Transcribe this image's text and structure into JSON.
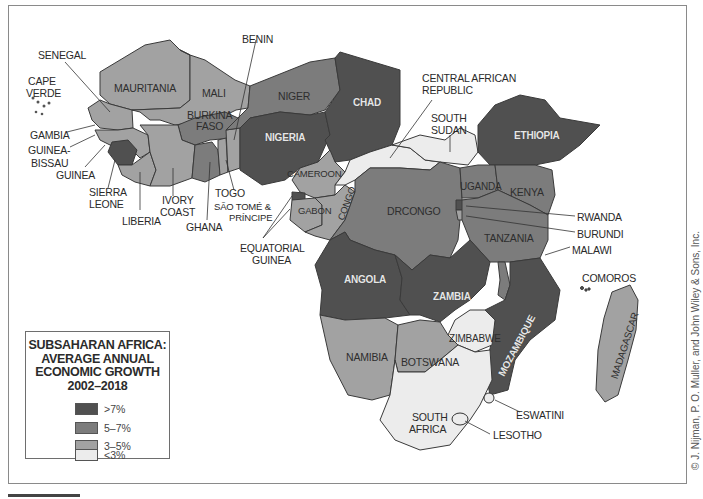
{
  "title": "SUBSAHARAN AFRICA: AVERAGE ANNUAL ECONOMIC GROWTH 2002–2018",
  "legend": {
    "title_lines": [
      "SUBSAHARAN AFRICA:",
      "AVERAGE ANNUAL",
      "ECONOMIC GROWTH",
      "2002–2018"
    ],
    "items": [
      {
        "label": ">7%",
        "color": "#505050"
      },
      {
        "label": "5–7%",
        "color": "#7c7c7c"
      },
      {
        "label": "3–5%",
        "color": "#a2a2a2"
      },
      {
        "label": "<3%",
        "color": "#ececec"
      }
    ]
  },
  "credit": "© J. Nijman, P. O. Muller, and John Wiley & Sons, Inc.",
  "colors": {
    "gt7": "#505050",
    "g5_7": "#7c7c7c",
    "g3_5": "#a2a2a2",
    "lt3": "#ececec",
    "border": "#3a3a3a"
  },
  "countries": {
    "senegal": {
      "label": "SENEGAL",
      "class": "3-5%"
    },
    "cape_verde": {
      "label": "CAPE VERDE",
      "class": "3-5%"
    },
    "mauritania": {
      "label": "MAURITANIA",
      "class": "3-5%"
    },
    "mali": {
      "label": "MALI",
      "class": "3-5%"
    },
    "benin": {
      "label": "BENIN",
      "class": "3-5%"
    },
    "niger": {
      "label": "NIGER",
      "class": "5-7%"
    },
    "chad": {
      "label": "CHAD",
      "class": ">7%"
    },
    "nigeria": {
      "label": "NIGERIA",
      "class": ">7%"
    },
    "burkina_faso": {
      "label": "BURKINA FASO",
      "class": "5-7%"
    },
    "gambia": {
      "label": "GAMBIA",
      "class": "3-5%"
    },
    "guinea_bissau": {
      "label": "GUINEA-BISSAU",
      "class": "3-5%"
    },
    "guinea": {
      "label": "GUINEA",
      "class": "3-5%"
    },
    "sierra_leone": {
      "label": "SIERRA LEONE",
      "class": ">7%"
    },
    "liberia": {
      "label": "LIBERIA",
      "class": "3-5%"
    },
    "ivory_coast": {
      "label": "IVORY COAST",
      "class": "3-5%"
    },
    "ghana": {
      "label": "GHANA",
      "class": "5-7%"
    },
    "togo": {
      "label": "TOGO",
      "class": "3-5%"
    },
    "sao_tome": {
      "label": "SÃO TOMÉ & PRÍNCIPE",
      "class": "3-5%"
    },
    "cameroon": {
      "label": "CAMEROON",
      "class": "3-5%"
    },
    "gabon": {
      "label": "GABON",
      "class": "3-5%"
    },
    "congo": {
      "label": "CONGO",
      "class": "3-5%"
    },
    "equatorial_guinea": {
      "label": "EQUATORIAL GUINEA",
      "class": ">7%"
    },
    "car": {
      "label": "CENTRAL AFRICAN REPUBLIC",
      "class": "<3%"
    },
    "south_sudan": {
      "label": "SOUTH SUDAN",
      "class": "<3%"
    },
    "ethiopia": {
      "label": "ETHIOPIA",
      "class": ">7%"
    },
    "uganda": {
      "label": "UGANDA",
      "class": "5-7%"
    },
    "kenya": {
      "label": "KENYA",
      "class": "5-7%"
    },
    "drcongo": {
      "label": "DRCONGO",
      "class": "5-7%"
    },
    "rwanda": {
      "label": "RWANDA",
      "class": ">7%"
    },
    "burundi": {
      "label": "BURUNDI",
      "class": "3-5%"
    },
    "tanzania": {
      "label": "TANZANIA",
      "class": "5-7%"
    },
    "malawi": {
      "label": "MALAWI",
      "class": "5-7%"
    },
    "comoros": {
      "label": "COMOROS",
      "class": "3-5%"
    },
    "angola": {
      "label": "ANGOLA",
      "class": ">7%"
    },
    "zambia": {
      "label": "ZAMBIA",
      "class": ">7%"
    },
    "mozambique": {
      "label": "MOZAMBIQUE",
      "class": ">7%"
    },
    "zimbabwe": {
      "label": "ZIMBABWE",
      "class": "<3%"
    },
    "namibia": {
      "label": "NAMIBIA",
      "class": "3-5%"
    },
    "botswana": {
      "label": "BOTSWANA",
      "class": "3-5%"
    },
    "madagascar": {
      "label": "MADAGASCAR",
      "class": "3-5%"
    },
    "south_africa": {
      "label": "SOUTH AFRICA",
      "class": "<3%"
    },
    "eswatini": {
      "label": "ESWATINI",
      "class": "<3%"
    },
    "lesotho": {
      "label": "LESOTHO",
      "class": "<3%"
    }
  },
  "label_text": {
    "senegal": "SENEGAL",
    "cape": "CAPE",
    "verde": "VERDE",
    "mauritania": "MAURITANIA",
    "mali": "MALI",
    "benin": "BENIN",
    "niger": "NIGER",
    "chad": "CHAD",
    "nigeria": "NIGERIA",
    "burkina": "BURKINA",
    "faso": "FASO",
    "gambia": "GAMBIA",
    "guinea_bissau_1": "GUINEA-",
    "guinea_bissau_2": "BISSAU",
    "guinea": "GUINEA",
    "sierra": "SIERRA",
    "leone": "LEONE",
    "liberia": "LIBERIA",
    "ivory": "IVORY",
    "coast": "COAST",
    "ghana": "GHANA",
    "togo": "TOGO",
    "sao_tome_1": "SÃO TOMÉ &",
    "sao_tome_2": "PRÍNCIPE",
    "cameroon": "CAMEROON",
    "gabon": "GABON",
    "congo": "CONGO",
    "eq_guinea_1": "EQUATORIAL",
    "eq_guinea_2": "GUINEA",
    "car_1": "CENTRAL AFRICAN",
    "car_2": "REPUBLIC",
    "south_sudan_1": "SOUTH",
    "south_sudan_2": "SUDAN",
    "ethiopia": "ETHIOPIA",
    "uganda": "UGANDA",
    "kenya": "KENYA",
    "drcongo": "DRCONGO",
    "rwanda": "RWANDA",
    "burundi": "BURUNDI",
    "tanzania": "TANZANIA",
    "malawi": "MALAWI",
    "comoros": "COMOROS",
    "angola": "ANGOLA",
    "zambia": "ZAMBIA",
    "mozambique": "MOZAMBIQUE",
    "zimbabwe": "ZIMBABWE",
    "namibia": "NAMIBIA",
    "botswana": "BOTSWANA",
    "madagascar": "MADAGASCAR",
    "south_africa_1": "SOUTH",
    "south_africa_2": "AFRICA",
    "eswatini": "ESWATINI",
    "lesotho": "LESOTHO"
  }
}
